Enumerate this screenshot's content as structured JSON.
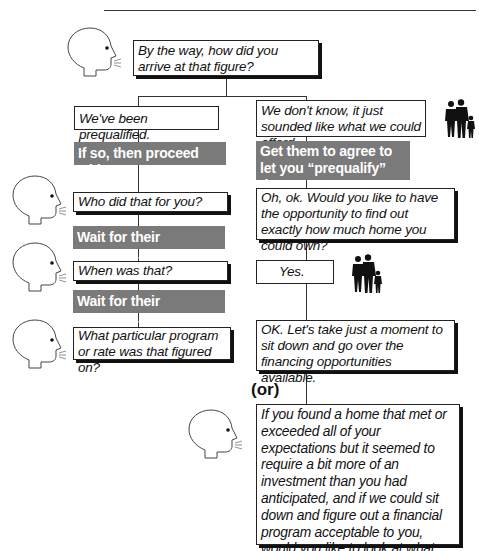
{
  "diagram": {
    "opening_question": "By the way, how did you arrive at that figure?",
    "left_branch": {
      "response": "We've been prequalified.",
      "instruction": "If so, then proceed with...",
      "q1": "Who did that for you?",
      "wait1": "Wait for their response.",
      "q2": "When was that?",
      "wait2": "Wait for their response.",
      "q3": "What particular program or rate was that figured on?"
    },
    "right_branch": {
      "response": "We don't know, it just sounded like what we could afford.",
      "instruction": "Get them to agree to let you “prequalify” them.",
      "q1": "Oh, ok. Would you like to have the opportunity to find out exactly how much home you could own?",
      "answer": "Yes.",
      "followup": "OK. Let's take just a moment to sit down and go over the financing opportunities available.",
      "or_label": "(or)",
      "alternative": "If you found a home that met or exceeded all of your expectations but it seemed to require a bit more of an investment than you had anticipated, and if we could sit down and figure out a financial program acceptable to you, would you like to look at what we have to offer?"
    },
    "icons": {
      "speaker": "speaking-head-icon",
      "family": "family-silhouette-icon"
    },
    "colors": {
      "instruction_bg": "#7a7a7a",
      "box_border": "#222222",
      "line": "#333333"
    }
  }
}
